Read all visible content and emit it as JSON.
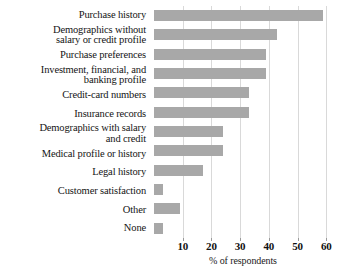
{
  "chart_data": {
    "type": "bar",
    "orientation": "horizontal",
    "title": "",
    "xlabel": "% of respondents",
    "ylabel": "",
    "xlim": [
      0,
      62
    ],
    "xticks": [
      10,
      20,
      30,
      40,
      50,
      60
    ],
    "xtick_labels": [
      "10",
      "20",
      "30",
      "40",
      "50",
      "60"
    ],
    "grid": true,
    "legend": "none",
    "bar_color": "#a8a8a8",
    "categories": [
      "Purchase history",
      "Demographics without\nsalary or credit profile",
      "Purchase preferences",
      "Investment, financial, and\nbanking profile",
      "Credit-card numbers",
      "Insurance records",
      "Demographics with salary\nand credit",
      "Medical profile or history",
      "Legal history",
      "Customer satisfaction",
      "Other",
      "None"
    ],
    "values": [
      59,
      43,
      39,
      39,
      33,
      33,
      24,
      24,
      17,
      3,
      9,
      3
    ]
  },
  "axis": {
    "title": "% of respondents"
  }
}
